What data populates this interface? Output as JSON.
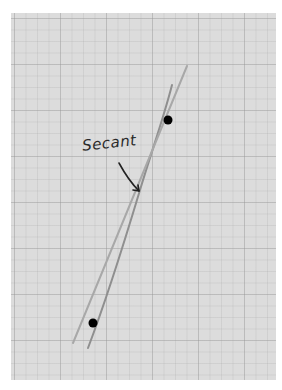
{
  "diagram": {
    "label": "Secant",
    "colors": {
      "paper": "#dcdcdc",
      "grid": "#b5b5b5",
      "curve": "#9a9a9a",
      "secant": "#a8a8a8",
      "points": "#000000",
      "text": "#2a2a2a"
    },
    "points": [
      {
        "name": "upper",
        "x": 168,
        "y": 120
      },
      {
        "name": "lower",
        "x": 93,
        "y": 323
      }
    ]
  }
}
